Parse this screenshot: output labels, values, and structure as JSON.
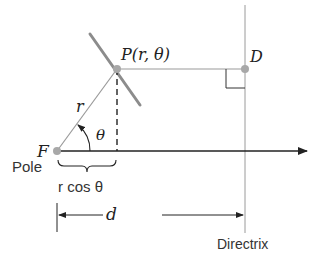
{
  "diagram": {
    "colors": {
      "line": "#222222",
      "gray": "#9a9a9a",
      "curve": "#8c8c8c",
      "point": "#a8a8a8"
    },
    "labels": {
      "point_p": "P(r, θ)",
      "point_d": "D",
      "focus": "F",
      "pole": "Pole",
      "radius": "r",
      "angle": "θ",
      "projection": "r cos θ",
      "distance": "d",
      "directrix": "Directrix"
    },
    "points": {
      "F": [
        57,
        151
      ],
      "P": [
        117,
        69
      ],
      "D": [
        245,
        69
      ]
    }
  }
}
